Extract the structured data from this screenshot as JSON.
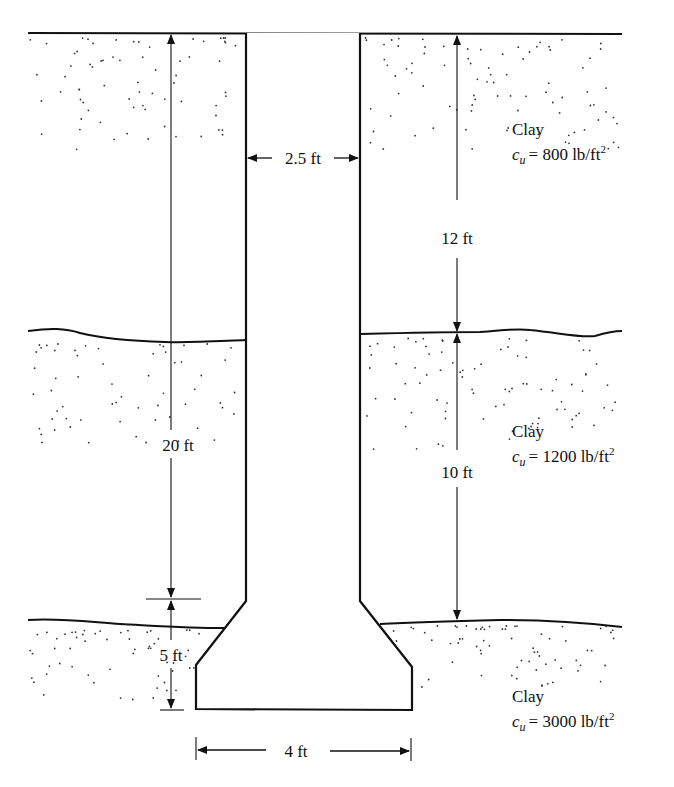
{
  "diagram": {
    "type": "drilled-shaft-with-bell",
    "shaft": {
      "diameter_label": "2.5 ft"
    },
    "bell": {
      "diameter_label": "4 ft",
      "height_label": "5 ft"
    },
    "shaft_length_label": "20 ft",
    "layers": [
      {
        "name": "Clay",
        "cu_symbol": "c",
        "cu_sub": "u",
        "cu_value": "= 800 lb/ft",
        "cu_exp": "2",
        "thickness_label": "12 ft"
      },
      {
        "name": "Clay",
        "cu_symbol": "c",
        "cu_sub": "u",
        "cu_value": "= 1200 lb/ft",
        "cu_exp": "2",
        "thickness_label": "10 ft"
      },
      {
        "name": "Clay",
        "cu_symbol": "c",
        "cu_sub": "u",
        "cu_value": "= 3000 lb/ft",
        "cu_exp": "2"
      }
    ],
    "colors": {
      "line": "#111111",
      "dots": "#333333",
      "background": "#ffffff"
    }
  }
}
